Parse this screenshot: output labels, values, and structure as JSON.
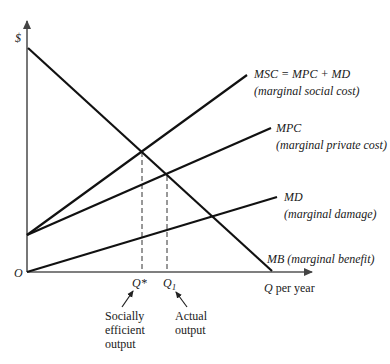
{
  "axes": {
    "y_label": "$",
    "origin_label": "O",
    "x_label_var": "Q",
    "x_label_suffix": " per year"
  },
  "curves": {
    "msc": {
      "name": "MSC = MPC + MD",
      "description": "(marginal social cost)"
    },
    "mpc": {
      "name": "MPC",
      "description": "(marginal private cost)"
    },
    "md": {
      "name": "MD",
      "description": "(marginal damage)"
    },
    "mb": {
      "name": "MB",
      "description": "(marginal benefit)"
    }
  },
  "markers": {
    "q_star": {
      "label": "Q*",
      "note": [
        "Socially",
        "efficient",
        "output"
      ]
    },
    "q_1": {
      "label_var": "Q",
      "label_sub": "1",
      "note": [
        "Actual",
        "output"
      ]
    }
  },
  "colors": {
    "line": "#111111",
    "axis": "#555555",
    "text": "#1a1a1a"
  }
}
